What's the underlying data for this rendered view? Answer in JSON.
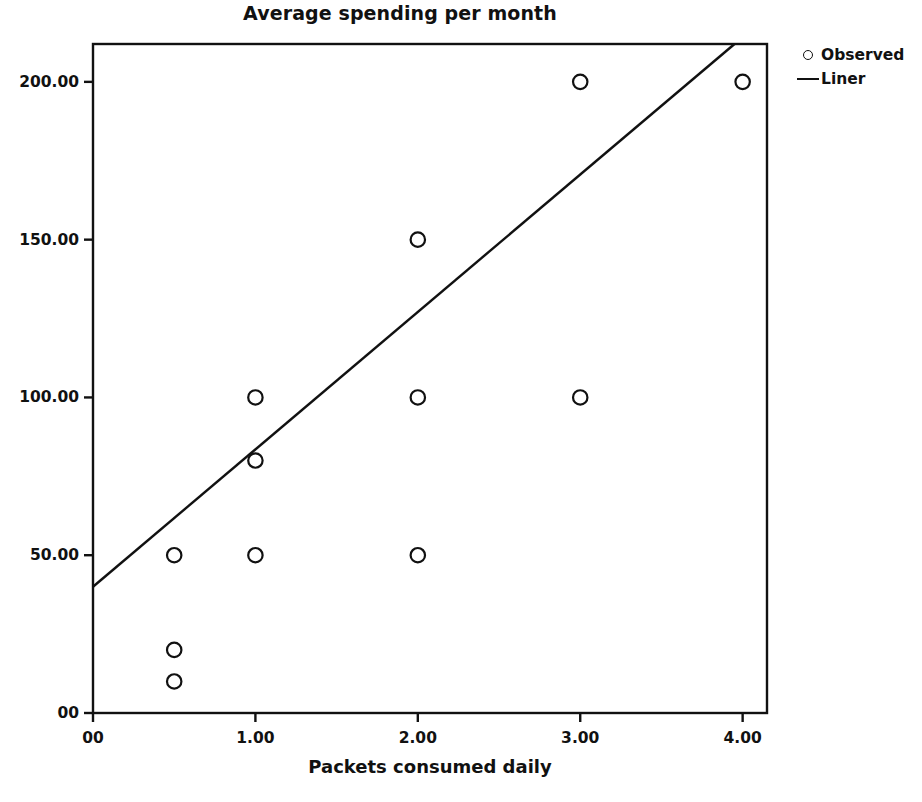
{
  "chart_data": {
    "type": "scatter",
    "title": "Average spending per month",
    "xlabel": "Packets consumed daily",
    "ylabel": "",
    "xlim": [
      0,
      4.15
    ],
    "ylim": [
      0,
      212
    ],
    "grid": false,
    "legend_position": "right",
    "x_ticks": [
      "00",
      "1.00",
      "2.00",
      "3.00",
      "4.00"
    ],
    "x_tick_values": [
      0,
      1,
      2,
      3,
      4
    ],
    "y_ticks": [
      "00",
      "50.00",
      "100.00",
      "150.00",
      "200.00"
    ],
    "y_tick_values": [
      0,
      50,
      100,
      150,
      200
    ],
    "series": [
      {
        "name": "Observed",
        "type": "scatter",
        "marker": "open-circle",
        "color": "#111111",
        "points": [
          {
            "x": 0.5,
            "y": 50
          },
          {
            "x": 0.5,
            "y": 20
          },
          {
            "x": 0.5,
            "y": 10
          },
          {
            "x": 1.0,
            "y": 100
          },
          {
            "x": 1.0,
            "y": 80
          },
          {
            "x": 1.0,
            "y": 50
          },
          {
            "x": 2.0,
            "y": 150
          },
          {
            "x": 2.0,
            "y": 100
          },
          {
            "x": 2.0,
            "y": 50
          },
          {
            "x": 3.0,
            "y": 200
          },
          {
            "x": 3.0,
            "y": 100
          },
          {
            "x": 4.0,
            "y": 200
          }
        ]
      },
      {
        "name": "Liner",
        "type": "line",
        "color": "#111111",
        "line": {
          "x0": 0,
          "y0": 40,
          "x1": 3.95,
          "y1": 212
        }
      }
    ]
  },
  "legend": {
    "items": [
      {
        "label": "Observed",
        "marker": "open-circle-marker-icon"
      },
      {
        "label": "Liner",
        "marker": "line-marker-icon"
      }
    ]
  },
  "colors": {
    "ink": "#111111",
    "background": "#ffffff"
  }
}
